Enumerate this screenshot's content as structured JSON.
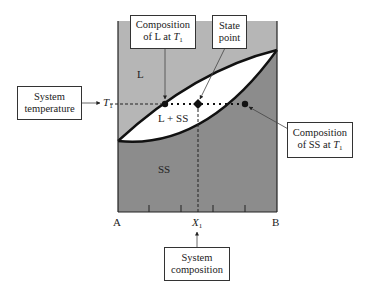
{
  "diagram": {
    "type": "binary isomorphous phase diagram",
    "axes": {
      "left_end": "A",
      "right_end": "B",
      "x_marker": "X",
      "x_marker_sub": "1",
      "y_marker": "T",
      "y_marker_sub": "1"
    },
    "regions": {
      "liquid": "L",
      "two_phase": "L + SS",
      "solid": "SS"
    },
    "callouts": {
      "comp_L": {
        "line1": "Composition",
        "line2": "of L at ",
        "var": "T",
        "sub": "1"
      },
      "state_point": {
        "line1": "State",
        "line2": "point"
      },
      "system_temperature": {
        "line1": "System",
        "line2": "temperature"
      },
      "comp_SS": {
        "line1": "Composition",
        "line2": "of SS at ",
        "var": "T",
        "sub": "1"
      },
      "system_composition": {
        "line1": "System",
        "line2": "composition"
      }
    },
    "colors": {
      "liquid_region": "#b6b6b6",
      "solid_region": "#8c8c8c",
      "two_phase_region": "#ffffff",
      "lines": "#111111"
    }
  }
}
